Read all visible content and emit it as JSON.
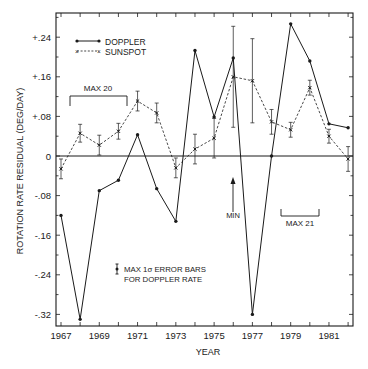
{
  "chart_data": {
    "type": "line",
    "title": "",
    "xlabel": "YEAR",
    "ylabel": "ROTATION RATE RESIDUAL (DEG/DAY)",
    "xlim": [
      1967,
      1982
    ],
    "ylim": [
      -0.32,
      0.24
    ],
    "x_ticks": [
      1967,
      1968,
      1969,
      1970,
      1971,
      1972,
      1973,
      1974,
      1975,
      1976,
      1977,
      1978,
      1979,
      1980,
      1981,
      1982
    ],
    "x_tick_labels": [
      "1967",
      "1969",
      "1971",
      "1973",
      "1975",
      "1977",
      "1979",
      "1981"
    ],
    "y_ticks": [
      0.24,
      0.16,
      0.08,
      0,
      -0.08,
      -0.16,
      -0.24,
      -0.32
    ],
    "y_tick_labels": [
      "+.24",
      "+.16",
      "+.08",
      "0",
      "-.08",
      "-.16",
      "-.24",
      "-.32"
    ],
    "grid": false,
    "zero_line": true,
    "legend_position": "upper left",
    "x": [
      1967,
      1968,
      1969,
      1970,
      1971,
      1972,
      1973,
      1974,
      1975,
      1976,
      1977,
      1978,
      1979,
      1980,
      1981,
      1982
    ],
    "series": [
      {
        "name": "DOPPLER",
        "style": "solid line, filled circle markers",
        "values": [
          -0.12,
          -0.33,
          -0.07,
          -0.049,
          0.043,
          -0.066,
          -0.132,
          0.213,
          0.079,
          0.198,
          -0.32,
          0.0,
          0.267,
          0.192,
          0.065,
          0.057
        ]
      },
      {
        "name": "SUNSPOT",
        "style": "dashed line, x markers with error bars",
        "values": [
          -0.026,
          0.046,
          0.022,
          0.05,
          0.111,
          0.087,
          -0.024,
          0.014,
          0.036,
          0.16,
          0.152,
          0.069,
          0.053,
          0.138,
          0.04,
          -0.006
        ],
        "errors": [
          0.02,
          0.018,
          0.02,
          0.016,
          0.02,
          0.02,
          0.02,
          0.03,
          0.04,
          0.102,
          0.085,
          0.025,
          0.015,
          0.015,
          0.014,
          0.025
        ]
      }
    ],
    "annotations": [
      {
        "text": "MAX 20",
        "type": "bracket",
        "x_range": [
          1967.5,
          1970.5
        ],
        "y": 0.12
      },
      {
        "text": "MAX 21",
        "type": "bracket",
        "x_range": [
          1978.5,
          1980.5
        ],
        "y": -0.12
      },
      {
        "text": "MIN",
        "type": "arrow",
        "x": 1976,
        "y_from": -0.12,
        "y_to": -0.05
      },
      {
        "text": "MAX 1σ ERROR BARS",
        "type": "note"
      },
      {
        "text": "FOR DOPPLER RATE",
        "type": "note"
      }
    ],
    "doppler_max_error": 0.011
  },
  "legend": {
    "doppler_label": "DOPPLER",
    "sunspot_label": "SUNSPOT"
  },
  "labels": {
    "xlabel": "YEAR",
    "ylabel": "ROTATION RATE RESIDUAL (DEG/DAY)",
    "max20": "MAX 20",
    "max21": "MAX 21",
    "min": "MIN",
    "note_line1": "MAX 1σ ERROR BARS",
    "note_line2": "FOR DOPPLER RATE"
  },
  "colors": {
    "ink": "#1a1a1a",
    "background": "#ffffff"
  }
}
